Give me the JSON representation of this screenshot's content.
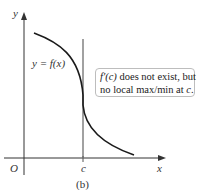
{
  "figure": {
    "caption": "(b)",
    "axes": {
      "x_label": "x",
      "y_label": "y",
      "origin_label": "O",
      "tick_label": "c"
    },
    "curve_label": "y = f(x)",
    "callout": {
      "line1_fn": "f′(c)",
      "line1_rest": " does not exist, but",
      "line2_prefix": "no local max/min at ",
      "line2_var": "c",
      "line2_suffix": "."
    },
    "colors": {
      "axis": "#333333",
      "curve": "#1a1a1a",
      "vertical_line": "#8a8a8a",
      "callout_border": "#bdbdbd"
    }
  }
}
